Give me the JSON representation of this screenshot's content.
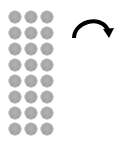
{
  "diagram": {
    "dot_grid": {
      "columns": 3,
      "rows": 8,
      "dot_color": "#a6a6a6",
      "dot_count": 24
    },
    "arrow": {
      "icon": "curved-clockwise-arrow-icon",
      "direction": "clockwise",
      "color": "#000000"
    }
  }
}
